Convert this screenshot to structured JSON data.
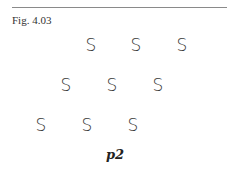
{
  "figure": {
    "label": "Fig. 4.03",
    "group_label": "p2",
    "motif_glyph": "S",
    "rows": [
      {
        "motifs": [
          {
            "x": 91,
            "y": 36
          },
          {
            "x": 136,
            "y": 36
          },
          {
            "x": 182,
            "y": 36
          }
        ]
      },
      {
        "motifs": [
          {
            "x": 66,
            "y": 76
          },
          {
            "x": 112,
            "y": 76
          },
          {
            "x": 158,
            "y": 76
          }
        ]
      },
      {
        "motifs": [
          {
            "x": 41,
            "y": 116
          },
          {
            "x": 87,
            "y": 116
          },
          {
            "x": 133,
            "y": 116
          }
        ]
      }
    ]
  }
}
